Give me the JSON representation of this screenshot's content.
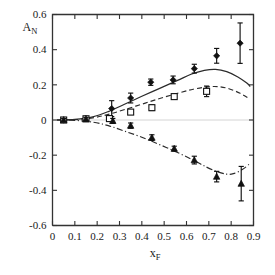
{
  "chart_data": {
    "type": "scatter",
    "title": "",
    "xlabel": "x_F",
    "ylabel": "A_N",
    "xlim": [
      0.0,
      0.9
    ],
    "ylim": [
      -0.6,
      0.6
    ],
    "xticks": [
      "0",
      "0.1",
      "0.2",
      "0.3",
      "0.4",
      "0.5",
      "0.6",
      "0.7",
      "0.8",
      "0.9"
    ],
    "xtick_values": [
      0.0,
      0.1,
      0.2,
      0.3,
      0.4,
      0.5,
      0.6,
      0.7,
      0.8,
      0.9
    ],
    "yticks": [
      "0.6",
      "0.4",
      "0.2",
      "0",
      "-0.2",
      "-0.4",
      "-0.6"
    ],
    "ytick_values": [
      0.6,
      0.4,
      0.2,
      0.0,
      -0.2,
      -0.4,
      -0.6
    ],
    "grid": false,
    "legend": "none",
    "zero_reference_line": true,
    "series": [
      {
        "name": "positive-asymmetry",
        "marker": "filled-diamond",
        "curve_style": "solid",
        "x": [
          0.05,
          0.15,
          0.265,
          0.35,
          0.44,
          0.54,
          0.635,
          0.735,
          0.84
        ],
        "values": [
          0.0,
          0.008,
          0.065,
          0.125,
          0.215,
          0.228,
          0.292,
          0.365,
          0.437
        ],
        "yerr": [
          0.008,
          0.012,
          0.045,
          0.028,
          0.018,
          0.022,
          0.025,
          0.042,
          0.115
        ]
      },
      {
        "name": "intermediate-asymmetry",
        "marker": "open-square",
        "curve_style": "dashed",
        "x": [
          0.05,
          0.15,
          0.255,
          0.35,
          0.445,
          0.545,
          0.69
        ],
        "values": [
          0.0,
          0.007,
          0.008,
          0.045,
          0.07,
          0.133,
          0.163
        ],
        "yerr": [
          0.008,
          0.01,
          0.016,
          0.012,
          0.016,
          0.014,
          0.03
        ]
      },
      {
        "name": "negative-asymmetry",
        "marker": "filled-triangle",
        "curve_style": "dash-dot",
        "x": [
          0.05,
          0.15,
          0.27,
          0.35,
          0.445,
          0.545,
          0.635,
          0.735,
          0.845
        ],
        "values": [
          0.0,
          0.005,
          -0.005,
          -0.032,
          -0.1,
          -0.163,
          -0.228,
          -0.322,
          -0.362
        ],
        "yerr": [
          0.008,
          0.01,
          0.014,
          0.015,
          0.016,
          0.014,
          0.022,
          0.03,
          0.098
        ]
      }
    ],
    "fit_curves": [
      {
        "name": "solid-fit",
        "style": "solid",
        "points": [
          [
            0.02,
            0.0
          ],
          [
            0.1,
            0.004
          ],
          [
            0.18,
            0.018
          ],
          [
            0.25,
            0.048
          ],
          [
            0.32,
            0.088
          ],
          [
            0.4,
            0.135
          ],
          [
            0.48,
            0.18
          ],
          [
            0.56,
            0.225
          ],
          [
            0.62,
            0.26
          ],
          [
            0.68,
            0.282
          ],
          [
            0.73,
            0.288
          ],
          [
            0.78,
            0.275
          ],
          [
            0.83,
            0.245
          ],
          [
            0.87,
            0.21
          ],
          [
            0.885,
            0.19
          ]
        ]
      },
      {
        "name": "dashed-fit",
        "style": "dashed",
        "points": [
          [
            0.02,
            0.0
          ],
          [
            0.1,
            0.002
          ],
          [
            0.18,
            0.012
          ],
          [
            0.25,
            0.032
          ],
          [
            0.32,
            0.058
          ],
          [
            0.4,
            0.09
          ],
          [
            0.48,
            0.122
          ],
          [
            0.56,
            0.152
          ],
          [
            0.63,
            0.175
          ],
          [
            0.69,
            0.188
          ],
          [
            0.74,
            0.19
          ],
          [
            0.79,
            0.178
          ],
          [
            0.84,
            0.152
          ],
          [
            0.88,
            0.122
          ]
        ]
      },
      {
        "name": "dashdot-fit",
        "style": "dash-dot",
        "points": [
          [
            0.02,
            0.0
          ],
          [
            0.1,
            -0.002
          ],
          [
            0.18,
            -0.012
          ],
          [
            0.25,
            -0.032
          ],
          [
            0.32,
            -0.062
          ],
          [
            0.4,
            -0.098
          ],
          [
            0.48,
            -0.14
          ],
          [
            0.56,
            -0.185
          ],
          [
            0.63,
            -0.228
          ],
          [
            0.69,
            -0.268
          ],
          [
            0.74,
            -0.295
          ],
          [
            0.78,
            -0.308
          ],
          [
            0.81,
            -0.305
          ],
          [
            0.85,
            -0.282
          ],
          [
            0.88,
            -0.252
          ]
        ]
      }
    ]
  }
}
